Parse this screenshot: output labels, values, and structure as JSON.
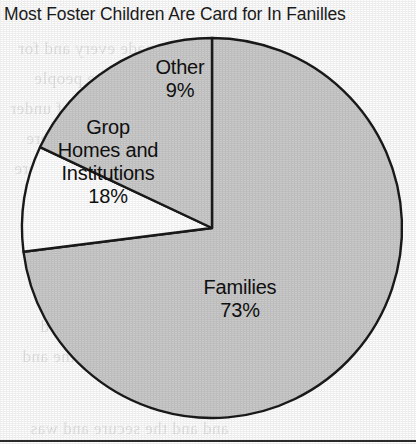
{
  "chart_data": {
    "type": "pie",
    "title": "Most Foster Children Are Card for In Fanilles",
    "categories": [
      "Families",
      "Other",
      "Grop Homes and Institutions"
    ],
    "values": [
      73,
      9,
      18
    ],
    "value_labels": [
      "73%",
      "9%",
      "18%"
    ],
    "slice_colors": [
      "#c9c9c9",
      "#ffffff",
      "#cacaca"
    ],
    "outline_color": "#1a1a1a",
    "start_angle_deg": 0,
    "direction": "clockwise",
    "legend": "none",
    "grid": false,
    "xlabel": "",
    "ylabel": "",
    "units": "percent",
    "slices": [
      {
        "name": "Families",
        "value": 73,
        "value_label": "73%",
        "label_line1": "Families",
        "color": "#c9c9c9"
      },
      {
        "name": "Other",
        "value": 9,
        "value_label": "9%",
        "label_line1": "Other",
        "color": "#ffffff"
      },
      {
        "name": "Group Homes and Institutions",
        "value": 18,
        "value_label": "18%",
        "label_line1": "Grop",
        "label_line2": "Homes and",
        "label_line3": "Institutions",
        "color": "#cacaca"
      }
    ]
  },
  "figure": {
    "title": "Most Foster Children Are Card for In Fanilles",
    "labels": {
      "other": {
        "name": "Other",
        "pct": "9%"
      },
      "group": {
        "line1": "Grop",
        "line2": "Homes and",
        "line3": "Institutions",
        "pct": "18%"
      },
      "families": {
        "name": "Families",
        "pct": "73%"
      }
    }
  },
  "background_bleed": [
    "any are made every and for",
    "involved in was this to the people",
    "up and hard of under",
    "to a the was most were",
    "so they and the there",
    "in the reason of and need",
    "the and how should the and",
    "and and the secure and was"
  ]
}
